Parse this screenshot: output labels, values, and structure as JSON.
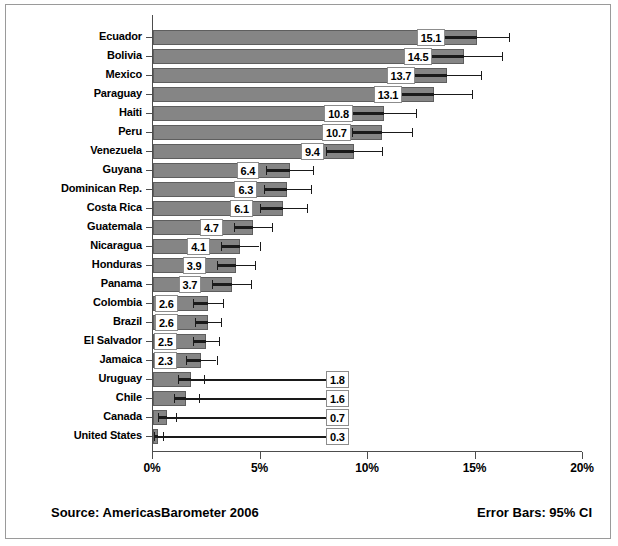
{
  "chart_data": {
    "type": "bar",
    "orientation": "horizontal",
    "title": "",
    "xlabel": "",
    "ylabel": "",
    "xlim": [
      0,
      20
    ],
    "grid": false,
    "legend": null,
    "error_bars": "95% CI",
    "xticks": [
      "0%",
      "5%",
      "10%",
      "15%",
      "20%"
    ],
    "xtick_values": [
      0,
      5,
      10,
      15,
      20
    ],
    "categories": [
      "Ecuador",
      "Bolivia",
      "Mexico",
      "Paraguay",
      "Haiti",
      "Peru",
      "Venezuela",
      "Guyana",
      "Dominican Rep.",
      "Costa Rica",
      "Guatemala",
      "Nicaragua",
      "Honduras",
      "Panama",
      "Colombia",
      "Brazil",
      "El Salvador",
      "Jamaica",
      "Uruguay",
      "Chile",
      "Canada",
      "United States"
    ],
    "values": [
      15.1,
      14.5,
      13.7,
      13.1,
      10.8,
      10.7,
      9.4,
      6.4,
      6.3,
      6.1,
      4.7,
      4.1,
      3.9,
      3.7,
      2.6,
      2.6,
      2.5,
      2.3,
      1.8,
      1.6,
      0.7,
      0.3
    ],
    "value_labels": [
      "15.1",
      "14.5",
      "13.7",
      "13.1",
      "10.8",
      "10.7",
      "9.4",
      "6.4",
      "6.3",
      "6.1",
      "4.7",
      "4.1",
      "3.9",
      "3.7",
      "2.6",
      "2.6",
      "2.5",
      "2.3",
      "1.8",
      "1.6",
      "0.7",
      "0.3"
    ],
    "ci_low": [
      13.6,
      12.7,
      12.1,
      11.3,
      9.3,
      9.3,
      8.1,
      5.3,
      5.2,
      5.0,
      3.8,
      3.2,
      3.0,
      2.8,
      1.9,
      2.0,
      1.9,
      1.6,
      1.2,
      1.0,
      0.3,
      0.1
    ],
    "ci_high": [
      16.6,
      16.3,
      15.3,
      14.9,
      12.3,
      12.1,
      10.7,
      7.5,
      7.4,
      7.2,
      5.6,
      5.0,
      4.8,
      4.6,
      3.3,
      3.2,
      3.1,
      3.0,
      2.4,
      2.2,
      1.1,
      0.5
    ],
    "colors": {
      "bar_fill": "#858585",
      "bar_edge": "#5e5e5e",
      "error_bar": "#1a1a1a",
      "axis": "#4d4d4d",
      "label_box_bg": "#ffffff",
      "label_box_edge": "#8c8c8c",
      "background": "#ffffff",
      "frame": "#9a9a9a"
    }
  },
  "footer": {
    "source": "Source: AmericasBarometer  2006",
    "error_bars_note": "Error Bars: 95% CI"
  }
}
